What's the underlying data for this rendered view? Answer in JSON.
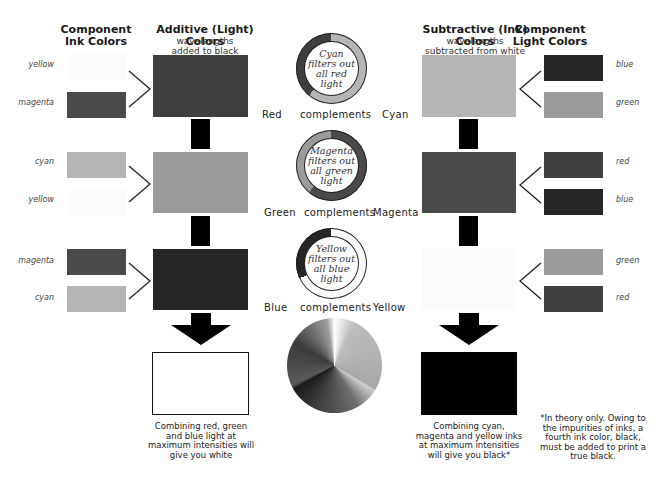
{
  "headers": {
    "component_ink": "Component\nInk Colors",
    "additive_title": "Additive (Light) Colors",
    "additive_sub": "wavelengths\nadded to black",
    "subtractive_title": "Subtractive (Ink) Colors",
    "subtractive_sub": "wavelengths\nsubtracted from white",
    "component_light": "Component\nLight Colors"
  },
  "colors": {
    "red": "#3f3f3f",
    "green": "#9b9b9b",
    "blue": "#262626",
    "cyan": "#b5b5b5",
    "magenta": "#4a4a4a",
    "yellow": "#fbfbfb",
    "white": "#ffffff",
    "black": "#000000"
  },
  "rows": [
    {
      "ink_labels": [
        "yellow",
        "magenta"
      ],
      "ink_colors": [
        "#fbfbfb",
        "#4a4a4a"
      ],
      "additive_color": "#3f3f3f",
      "complement": {
        "left": "Red",
        "middle": "complements",
        "right": "Cyan"
      },
      "filter_text": "Cyan\nfilters out\nall red\nlight",
      "ring_colors": {
        "major": "#b5b5b5",
        "minor": "#3f3f3f"
      },
      "subtractive_color": "#b5b5b5",
      "light_labels": [
        "blue",
        "green"
      ],
      "light_colors": [
        "#262626",
        "#9b9b9b"
      ]
    },
    {
      "ink_labels": [
        "cyan",
        "yellow"
      ],
      "ink_colors": [
        "#b5b5b5",
        "#fbfbfb"
      ],
      "additive_color": "#9b9b9b",
      "complement": {
        "left": "Green",
        "middle": "complements",
        "right": "Magenta"
      },
      "filter_text": "Magenta\nfilters out\nall green\nlight",
      "ring_colors": {
        "major": "#4a4a4a",
        "minor": "#9b9b9b"
      },
      "subtractive_color": "#4a4a4a",
      "light_labels": [
        "red",
        "blue"
      ],
      "light_colors": [
        "#3f3f3f",
        "#262626"
      ]
    },
    {
      "ink_labels": [
        "magenta",
        "cyan"
      ],
      "ink_colors": [
        "#4a4a4a",
        "#b5b5b5"
      ],
      "additive_color": "#262626",
      "complement": {
        "left": "Blue",
        "middle": "complements",
        "right": "Yellow"
      },
      "filter_text": "Yellow\nfilters out\nall blue\nlight",
      "ring_colors": {
        "major": "#fbfbfb",
        "minor": "#262626"
      },
      "subtractive_color": "#fbfbfb",
      "light_labels": [
        "green",
        "red"
      ],
      "light_colors": [
        "#9b9b9b",
        "#3f3f3f"
      ]
    }
  ],
  "results": {
    "additive_caption": "Combining red, green\nand blue light at\nmaximum intensities will\ngive you white",
    "subtractive_caption": "Combining cyan,\nmagenta and yellow inks\nat maximum intensities\nwill give you black*",
    "footnote": "*In theory only. Owing to\nthe impurities of inks, a\nfourth ink color, black,\nmust be added to print a\ntrue black."
  }
}
